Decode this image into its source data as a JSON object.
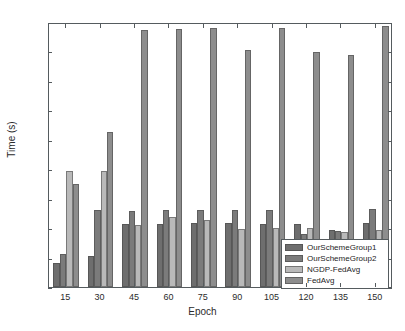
{
  "chart_data": {
    "type": "bar",
    "title": "",
    "xlabel": "Epoch",
    "ylabel": "Time (s)",
    "categories": [
      "15",
      "30",
      "45",
      "60",
      "75",
      "90",
      "105",
      "120",
      "135",
      "150"
    ],
    "ylim": [
      0,
      9000
    ],
    "yticks": [
      0,
      1000,
      2000,
      3000,
      4000,
      5000,
      6000,
      7000,
      8000,
      9000
    ],
    "ytick_labels": [
      "0",
      "1000",
      "2000",
      "3000",
      "4000",
      "5000",
      "6000",
      "7000",
      "8000",
      "9000"
    ],
    "grid": false,
    "legend_position": "lower right",
    "series": [
      {
        "name": "OurSchemeGroup1",
        "color": "#6e6e6e",
        "values": [
          800,
          1050,
          2140,
          2140,
          2180,
          2160,
          2140,
          2150,
          1940,
          2180
        ]
      },
      {
        "name": "OurSchemeGroup2",
        "color": "#7b7b7b",
        "values": [
          1110,
          2620,
          2580,
          2620,
          2620,
          2620,
          2610,
          1790,
          1900,
          2650
        ]
      },
      {
        "name": "NGDP-FedAvg",
        "color": "#b9b9b9",
        "values": [
          3950,
          3950,
          2100,
          2370,
          2270,
          1960,
          2010,
          1990,
          1870,
          1950
        ]
      },
      {
        "name": "FedAvg",
        "color": "#8d8d8d",
        "values": [
          3490,
          5250,
          8720,
          8760,
          8810,
          8040,
          8800,
          7980,
          7880,
          8850
        ]
      }
    ]
  }
}
